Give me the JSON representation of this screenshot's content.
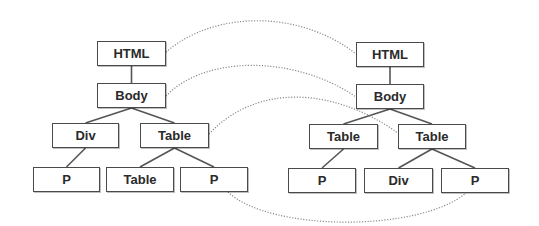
{
  "diagram": {
    "type": "DOM tree comparison",
    "colors": {
      "box_border": "#4a4a4a",
      "text": "#2a2a2a",
      "edge": "#555555",
      "mapping": "#8a8a8a"
    },
    "left_tree": {
      "nodes": [
        {
          "id": "L_html",
          "label": "HTML",
          "x": 97,
          "y": 41,
          "w": 69,
          "h": 25
        },
        {
          "id": "L_body",
          "label": "Body",
          "x": 97,
          "y": 83,
          "w": 69,
          "h": 25
        },
        {
          "id": "L_div",
          "label": "Div",
          "x": 52,
          "y": 123,
          "w": 67,
          "h": 25
        },
        {
          "id": "L_table",
          "label": "Table",
          "x": 140,
          "y": 123,
          "w": 69,
          "h": 25
        },
        {
          "id": "L_p1",
          "label": "P",
          "x": 33,
          "y": 167,
          "w": 67,
          "h": 25
        },
        {
          "id": "L_table2",
          "label": "Table",
          "x": 106,
          "y": 167,
          "w": 68,
          "h": 25
        },
        {
          "id": "L_p2",
          "label": "P",
          "x": 180,
          "y": 167,
          "w": 68,
          "h": 25
        }
      ],
      "edges": [
        [
          "L_html",
          "L_body"
        ],
        [
          "L_body",
          "L_div"
        ],
        [
          "L_body",
          "L_table"
        ],
        [
          "L_div",
          "L_p1"
        ],
        [
          "L_table",
          "L_table2"
        ],
        [
          "L_table",
          "L_p2"
        ]
      ]
    },
    "right_tree": {
      "nodes": [
        {
          "id": "R_html",
          "label": "HTML",
          "x": 356,
          "y": 42,
          "w": 68,
          "h": 25
        },
        {
          "id": "R_body",
          "label": "Body",
          "x": 356,
          "y": 84,
          "w": 68,
          "h": 25
        },
        {
          "id": "R_table1",
          "label": "Table",
          "x": 309,
          "y": 124,
          "w": 69,
          "h": 25
        },
        {
          "id": "R_table2",
          "label": "Table",
          "x": 398,
          "y": 124,
          "w": 68,
          "h": 25
        },
        {
          "id": "R_p1",
          "label": "P",
          "x": 288,
          "y": 168,
          "w": 68,
          "h": 25
        },
        {
          "id": "R_div",
          "label": "Div",
          "x": 364,
          "y": 168,
          "w": 69,
          "h": 25
        },
        {
          "id": "R_p2",
          "label": "P",
          "x": 441,
          "y": 168,
          "w": 68,
          "h": 25
        }
      ],
      "edges": [
        [
          "R_html",
          "R_body"
        ],
        [
          "R_body",
          "R_table1"
        ],
        [
          "R_body",
          "R_table2"
        ],
        [
          "R_table1",
          "R_p1"
        ],
        [
          "R_table2",
          "R_div"
        ],
        [
          "R_table2",
          "R_p2"
        ]
      ]
    },
    "mappings": [
      {
        "from": "L_html",
        "to": "R_html",
        "path": "M166,52 C215,10 300,10 356,54"
      },
      {
        "from": "L_body",
        "to": "R_body",
        "path": "M166,96 C205,55 295,55 356,97"
      },
      {
        "from": "L_table",
        "to": "R_table2",
        "path": "M209,134 C255,85 330,85 398,133"
      },
      {
        "from": "L_p2",
        "to": "R_p2",
        "path": "M228,192 C270,232 420,232 466,193"
      }
    ]
  }
}
